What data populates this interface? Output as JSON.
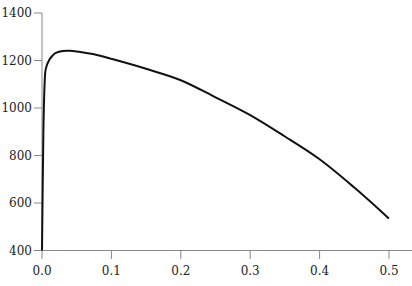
{
  "chart_data": {
    "type": "line",
    "title": "",
    "xlabel": "",
    "ylabel": "",
    "xlim": [
      0.0,
      0.5
    ],
    "ylim": [
      400,
      1400
    ],
    "grid": false,
    "legend": null,
    "x_ticks": [
      "0.0",
      "0.1",
      "0.2",
      "0.3",
      "0.4",
      "0.5"
    ],
    "y_ticks": [
      "400",
      "600",
      "800",
      "1000",
      "1200",
      "1400"
    ],
    "series": [
      {
        "name": "curve",
        "color": "#111111",
        "x": [
          0.0,
          0.002,
          0.004,
          0.006,
          0.01,
          0.015,
          0.02,
          0.03,
          0.04,
          0.05,
          0.075,
          0.1,
          0.15,
          0.2,
          0.25,
          0.3,
          0.35,
          0.4,
          0.45,
          0.5
        ],
        "y": [
          400,
          900,
          1120,
          1170,
          1200,
          1220,
          1232,
          1240,
          1241,
          1238,
          1226,
          1207,
          1165,
          1117,
          1045,
          970,
          880,
          784,
          665,
          535
        ]
      }
    ]
  },
  "axes": {
    "axis_color": "#888888",
    "x_ticks": [
      "0.0",
      "0.1",
      "0.2",
      "0.3",
      "0.4",
      "0.5"
    ],
    "y_ticks": [
      "400",
      "600",
      "800",
      "1000",
      "1200",
      "1400"
    ]
  }
}
